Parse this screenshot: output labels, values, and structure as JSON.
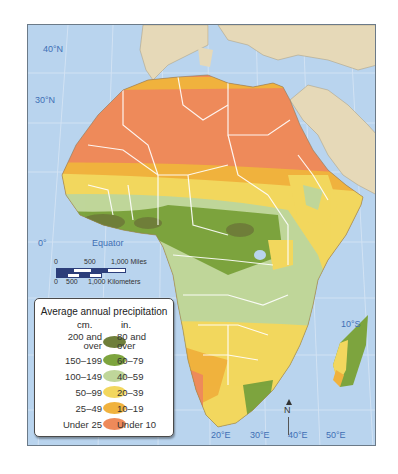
{
  "map": {
    "title_region": "Africa",
    "latitude_labels": [
      {
        "label": "40°N"
      },
      {
        "label": "30°N"
      },
      {
        "label": "0°"
      },
      {
        "label": "10°S"
      }
    ],
    "equator_label": "Equator",
    "longitude_labels": [
      {
        "label": "20°E"
      },
      {
        "label": "30°E"
      },
      {
        "label": "40°E"
      },
      {
        "label": "50°E"
      }
    ],
    "north_arrow": "N",
    "scale_bar": {
      "miles": {
        "zero": "0",
        "mid": "500",
        "end": "1,000 Miles"
      },
      "km": {
        "zero": "0",
        "mid": "500",
        "end": "1,000 Kilometers"
      }
    }
  },
  "legend": {
    "title": "Average annual precipitation",
    "col_cm": "cm.",
    "col_in": "in.",
    "items": [
      {
        "cm": "200 and over",
        "cm_l1": "200 and",
        "cm_l2": "over",
        "in": "80 and over",
        "in_l1": "80 and",
        "in_l2": "over",
        "color": "#6f7f3a"
      },
      {
        "cm": "150–199",
        "in": "60–79",
        "color": "#7da43e"
      },
      {
        "cm": "100–149",
        "in": "40–59",
        "color": "#bfd69a"
      },
      {
        "cm": "50–99",
        "in": "20–39",
        "color": "#f2d75e"
      },
      {
        "cm": "25–49",
        "in": "10–19",
        "color": "#f0b23e"
      },
      {
        "cm": "Under 25",
        "in": "Under 10",
        "color": "#ee8a5a"
      }
    ]
  },
  "colors": {
    "ocean": "#b9d4ee",
    "land_other": "#e6d9b8",
    "borders": "#ffffff",
    "label_blue": "#3f6fb5"
  }
}
